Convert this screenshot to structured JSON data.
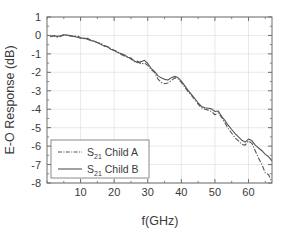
{
  "chart_data": {
    "type": "line",
    "title": "",
    "xlabel": "f(GHz)",
    "ylabel": "E-O Response (dB)",
    "xlim": [
      0,
      67
    ],
    "ylim": [
      -8,
      1
    ],
    "xticks": [
      10,
      20,
      30,
      40,
      50,
      60
    ],
    "yticks": [
      1,
      0,
      -1,
      -2,
      -3,
      -4,
      -5,
      -6,
      -7,
      -8
    ],
    "xtick_labels": [
      "10",
      "20",
      "30",
      "40",
      "50",
      "60"
    ],
    "ytick_labels": [
      "1",
      "0",
      "-1",
      "-2",
      "-3",
      "-4",
      "-5",
      "-6",
      "-7",
      "-8"
    ],
    "minor_tick_step_x": 5,
    "minor_tick_step_y": 0.5,
    "grid": true,
    "grid_color": "#dcdcdc",
    "axis_color": "#6e6e6e",
    "legend_position": "lower left",
    "legend": [
      {
        "name": "S21 Child A",
        "base": "S",
        "sub": "21",
        "suffix": " Child A",
        "style": "dashdot",
        "color": "#555555"
      },
      {
        "name": "S21 Child B",
        "base": "S",
        "sub": "21",
        "suffix": " Child B",
        "style": "solid",
        "color": "#555555"
      }
    ],
    "series": [
      {
        "name": "S21 Child A",
        "style": "dashdot",
        "color": "#555555",
        "x": [
          1,
          2,
          3,
          4,
          5,
          6,
          7,
          8,
          9,
          10,
          11,
          12,
          13,
          14,
          15,
          16,
          17,
          18,
          19,
          20,
          21,
          22,
          23,
          24,
          25,
          26,
          27,
          28,
          29,
          30,
          31,
          32,
          33,
          34,
          35,
          36,
          37,
          38,
          39,
          40,
          41,
          42,
          43,
          44,
          45,
          46,
          47,
          48,
          49,
          50,
          51,
          52,
          53,
          54,
          55,
          56,
          57,
          58,
          59,
          60,
          61,
          62,
          63,
          64,
          65,
          66,
          67
        ],
        "y": [
          -0.05,
          -0.02,
          -0.1,
          -0.05,
          0.02,
          0.0,
          -0.03,
          -0.06,
          -0.02,
          -0.12,
          -0.18,
          -0.15,
          -0.25,
          -0.32,
          -0.38,
          -0.42,
          -0.55,
          -0.62,
          -0.72,
          -0.8,
          -0.88,
          -1.02,
          -1.12,
          -1.15,
          -1.28,
          -1.42,
          -1.4,
          -1.55,
          -1.5,
          -1.62,
          -1.85,
          -2.0,
          -2.35,
          -2.55,
          -2.62,
          -2.58,
          -2.45,
          -2.3,
          -2.35,
          -2.55,
          -2.8,
          -3.05,
          -3.25,
          -3.48,
          -3.72,
          -3.92,
          -4.0,
          -4.05,
          -4.12,
          -4.3,
          -4.2,
          -4.45,
          -4.75,
          -5.05,
          -5.3,
          -5.55,
          -5.72,
          -5.9,
          -5.95,
          -5.72,
          -5.85,
          -6.25,
          -6.65,
          -7.0,
          -7.45,
          -7.55,
          -7.95
        ]
      },
      {
        "name": "S21 Child B",
        "style": "solid",
        "color": "#555555",
        "x": [
          1,
          2,
          3,
          4,
          5,
          6,
          7,
          8,
          9,
          10,
          11,
          12,
          13,
          14,
          15,
          16,
          17,
          18,
          19,
          20,
          21,
          22,
          23,
          24,
          25,
          26,
          27,
          28,
          29,
          30,
          31,
          32,
          33,
          34,
          35,
          36,
          37,
          38,
          39,
          40,
          41,
          42,
          43,
          44,
          45,
          46,
          47,
          48,
          49,
          50,
          51,
          52,
          53,
          54,
          55,
          56,
          57,
          58,
          59,
          60,
          61,
          62,
          63,
          64,
          65,
          66,
          67
        ],
        "y": [
          -0.08,
          0.0,
          -0.05,
          -0.02,
          0.04,
          0.02,
          -0.01,
          -0.05,
          -0.1,
          -0.15,
          -0.14,
          -0.2,
          -0.28,
          -0.3,
          -0.4,
          -0.48,
          -0.58,
          -0.6,
          -0.75,
          -0.82,
          -0.92,
          -0.98,
          -1.05,
          -1.18,
          -1.22,
          -1.38,
          -1.48,
          -1.42,
          -1.35,
          -1.52,
          -1.78,
          -1.95,
          -2.18,
          -2.3,
          -2.38,
          -2.42,
          -2.3,
          -2.22,
          -2.28,
          -2.48,
          -2.72,
          -2.98,
          -3.2,
          -3.42,
          -3.65,
          -3.85,
          -3.92,
          -3.95,
          -3.98,
          -4.12,
          -4.1,
          -4.38,
          -4.62,
          -4.88,
          -5.1,
          -5.32,
          -5.5,
          -5.68,
          -5.78,
          -5.62,
          -5.7,
          -5.95,
          -6.1,
          -6.25,
          -6.45,
          -6.58,
          -6.8
        ]
      }
    ]
  }
}
